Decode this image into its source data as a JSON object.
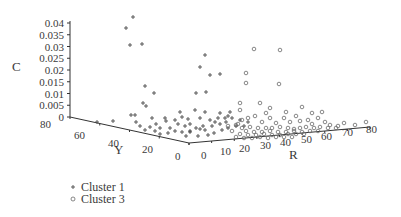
{
  "chart_data": {
    "type": "scatter",
    "projection": "3d",
    "title": "",
    "axes": {
      "c": {
        "label": "C",
        "ticks": [
          "0.04",
          "0.035",
          "0.03",
          "0.025",
          "0.02",
          "0.015",
          "0.01",
          "0.005",
          "0"
        ],
        "range": [
          0,
          0.04
        ]
      },
      "y": {
        "label": "Y",
        "ticks": [
          "80",
          "60",
          "40",
          "20",
          "0"
        ],
        "range": [
          0,
          80
        ]
      },
      "r": {
        "label": "R",
        "ticks": [
          "0",
          "10",
          "20",
          "30",
          "40",
          "50",
          "60",
          "70",
          "80"
        ],
        "range": [
          0,
          80
        ]
      }
    },
    "legend": [
      {
        "name": "Cluster 1",
        "marker": "plus"
      },
      {
        "name": "Cluster 3",
        "marker": "circle"
      }
    ],
    "legend_position": "bottom-left",
    "series": [
      {
        "name": "Cluster 1",
        "marker": "plus",
        "screen_points": [
          [
            133,
            17
          ],
          [
            126,
            28
          ],
          [
            130,
            45
          ],
          [
            142,
            44
          ],
          [
            205,
            55
          ],
          [
            200,
            67
          ],
          [
            210,
            75
          ],
          [
            220,
            74
          ],
          [
            145,
            86
          ],
          [
            154,
            93
          ],
          [
            196,
            93
          ],
          [
            206,
            92
          ],
          [
            143,
            103
          ],
          [
            146,
            106
          ],
          [
            131,
            115
          ],
          [
            135,
            115
          ],
          [
            152,
            118
          ],
          [
            165,
            118
          ],
          [
            182,
            117
          ],
          [
            188,
            119
          ],
          [
            113,
            121
          ],
          [
            97,
            122
          ],
          [
            166,
            121
          ],
          [
            175,
            120
          ],
          [
            178,
            124
          ],
          [
            156,
            124
          ],
          [
            150,
            127
          ],
          [
            160,
            128
          ],
          [
            170,
            128
          ],
          [
            185,
            126
          ],
          [
            190,
            124
          ],
          [
            200,
            118
          ],
          [
            205,
            112
          ],
          [
            210,
            120
          ],
          [
            215,
            122
          ],
          [
            220,
            124
          ],
          [
            225,
            118
          ],
          [
            228,
            116
          ],
          [
            218,
            118
          ],
          [
            212,
            126
          ],
          [
            196,
            128
          ],
          [
            200,
            129
          ],
          [
            205,
            130
          ],
          [
            190,
            131
          ],
          [
            182,
            132
          ],
          [
            175,
            131
          ],
          [
            168,
            133
          ],
          [
            160,
            134
          ],
          [
            155,
            131
          ],
          [
            145,
            130
          ],
          [
            140,
            126
          ],
          [
            136,
            122
          ],
          [
            180,
            112
          ],
          [
            195,
            110
          ],
          [
            230,
            112
          ],
          [
            232,
            118
          ],
          [
            240,
            120
          ],
          [
            236,
            126
          ],
          [
            228,
            128
          ],
          [
            222,
            130
          ],
          [
            214,
            133
          ],
          [
            208,
            135
          ],
          [
            198,
            136
          ],
          [
            186,
            136
          ],
          [
            190,
            132
          ],
          [
            203,
            126
          ],
          [
            226,
            122
          ],
          [
            244,
            126
          ],
          [
            248,
            122
          ],
          [
            220,
            113
          ]
        ]
      },
      {
        "name": "Cluster 3",
        "marker": "circle",
        "screen_points": [
          [
            254,
            49
          ],
          [
            280,
            50
          ],
          [
            246,
            73
          ],
          [
            246,
            83
          ],
          [
            279,
            84
          ],
          [
            240,
            103
          ],
          [
            240,
            110
          ],
          [
            270,
            108
          ],
          [
            260,
            103
          ],
          [
            302,
            107
          ],
          [
            248,
            118
          ],
          [
            255,
            116
          ],
          [
            242,
            120
          ],
          [
            262,
            122
          ],
          [
            270,
            118
          ],
          [
            276,
            123
          ],
          [
            284,
            118
          ],
          [
            290,
            122
          ],
          [
            296,
            116
          ],
          [
            300,
            121
          ],
          [
            308,
            120
          ],
          [
            312,
            124
          ],
          [
            318,
            118
          ],
          [
            325,
            122
          ],
          [
            330,
            125
          ],
          [
            338,
            126
          ],
          [
            344,
            123
          ],
          [
            355,
            125
          ],
          [
            366,
            122
          ],
          [
            236,
            125
          ],
          [
            242,
            128
          ],
          [
            250,
            127
          ],
          [
            258,
            128
          ],
          [
            266,
            128
          ],
          [
            272,
            128
          ],
          [
            280,
            127
          ],
          [
            288,
            128
          ],
          [
            294,
            129
          ],
          [
            300,
            128
          ],
          [
            306,
            127
          ],
          [
            314,
            128
          ],
          [
            320,
            127
          ],
          [
            328,
            128
          ],
          [
            336,
            128
          ],
          [
            246,
            131
          ],
          [
            254,
            132
          ],
          [
            262,
            132
          ],
          [
            270,
            131
          ],
          [
            278,
            132
          ],
          [
            286,
            132
          ],
          [
            294,
            131
          ],
          [
            302,
            132
          ],
          [
            310,
            131
          ],
          [
            318,
            131
          ],
          [
            240,
            134
          ],
          [
            248,
            135
          ],
          [
            256,
            135
          ],
          [
            264,
            134
          ],
          [
            272,
            135
          ],
          [
            280,
            135
          ],
          [
            288,
            134
          ],
          [
            296,
            134
          ],
          [
            304,
            134
          ],
          [
            236,
            137
          ],
          [
            244,
            138
          ],
          [
            252,
            138
          ],
          [
            260,
            137
          ],
          [
            268,
            138
          ],
          [
            276,
            137
          ],
          [
            284,
            137
          ],
          [
            292,
            137
          ],
          [
            232,
            131
          ],
          [
            238,
            124
          ],
          [
            228,
            126
          ],
          [
            266,
            113
          ],
          [
            286,
            112
          ],
          [
            312,
            113
          ],
          [
            322,
            112
          ]
        ]
      }
    ],
    "grid": false
  }
}
